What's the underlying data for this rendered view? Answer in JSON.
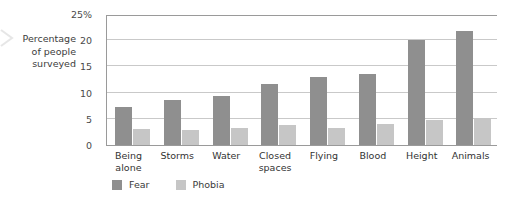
{
  "chart_data": {
    "type": "bar",
    "title": "",
    "subtitle": "",
    "xlabel": "",
    "ylabel": "Percentage of people surveyed",
    "ylabel_lines": [
      "Percentage",
      "of people",
      "surveyed"
    ],
    "categories": [
      "Being alone",
      "Storms",
      "Water",
      "Closed spaces",
      "Flying",
      "Blood",
      "Height",
      "Animals"
    ],
    "category_lines": [
      [
        "Being",
        "alone"
      ],
      [
        "Storms"
      ],
      [
        "Water"
      ],
      [
        "Closed",
        "spaces"
      ],
      [
        "Flying"
      ],
      [
        "Blood"
      ],
      [
        "Height"
      ],
      [
        "Animals"
      ]
    ],
    "series": [
      {
        "name": "Fear",
        "color": "#8f8f8f",
        "values": [
          7.3,
          8.6,
          9.3,
          11.6,
          12.9,
          13.5,
          20.0,
          21.7
        ]
      },
      {
        "name": "Phobia",
        "color": "#c6c6c6",
        "values": [
          3.1,
          2.9,
          3.2,
          3.9,
          3.2,
          4.1,
          4.8,
          5.2
        ]
      }
    ],
    "ylim": [
      0,
      25
    ],
    "ytick_values": [
      0,
      5,
      10,
      15,
      20,
      25
    ],
    "ytick_labels": [
      "0",
      "5",
      "10",
      "15",
      "20",
      "25%"
    ],
    "grid": true,
    "grid_axis": "y",
    "legend_position": "bottom-left"
  },
  "legend": {
    "items": [
      {
        "label": "Fear",
        "color": "#8f8f8f"
      },
      {
        "label": "Phobia",
        "color": "#c6c6c6"
      }
    ]
  }
}
